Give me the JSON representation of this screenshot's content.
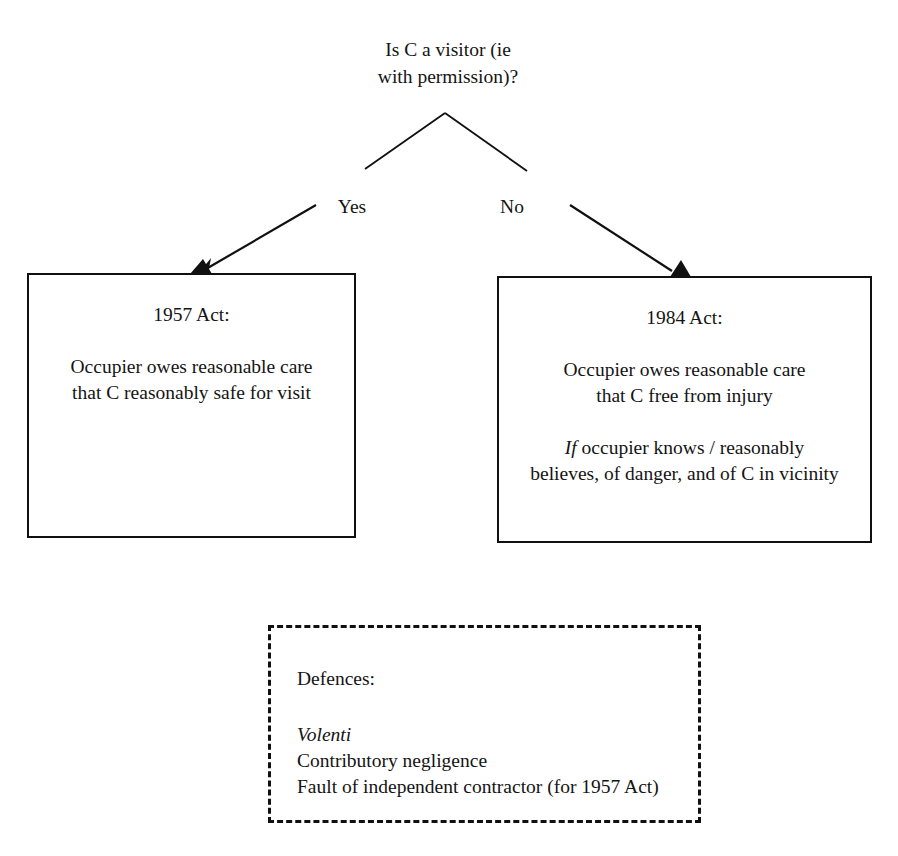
{
  "diagram": {
    "title_text": "Is C a visitor (ie\nwith permission)?",
    "root_question": {
      "line1": "Is C a visitor (ie",
      "line2": "with permission)?",
      "text": "Is C a visitor (ie\nwith permission)?"
    },
    "branches": [
      {
        "id": "yes",
        "label": "Yes",
        "leads_to": "1957 Act:"
      },
      {
        "id": "no",
        "label": "No",
        "leads_to": "1984 Act:"
      }
    ],
    "outcome_boxes": [
      {
        "id": "act-1957",
        "heading": "1957 Act:",
        "paragraphs": [
          {
            "italic_lead": "",
            "text": "Occupier owes reasonable care\nthat C reasonably safe for visit"
          }
        ]
      },
      {
        "id": "act-1984",
        "heading": "1984 Act:",
        "paragraphs": [
          {
            "italic_lead": "",
            "text": "Occupier owes reasonable care\nthat C free from injury"
          },
          {
            "italic_lead": "If",
            "text": " occupier knows / reasonably\nbelieves, of danger, and of C in vicinity"
          }
        ]
      }
    ],
    "defences": {
      "heading": "Defences:",
      "items": [
        {
          "label": "Volenti",
          "italic": true
        },
        {
          "label": "Contributory negligence",
          "italic": false
        },
        {
          "label": "Fault of independent contractor (for 1957 Act)",
          "italic": false
        }
      ]
    },
    "style": {
      "line_color": "#101010",
      "text_color": "#141414",
      "background": "#ffffff"
    }
  }
}
